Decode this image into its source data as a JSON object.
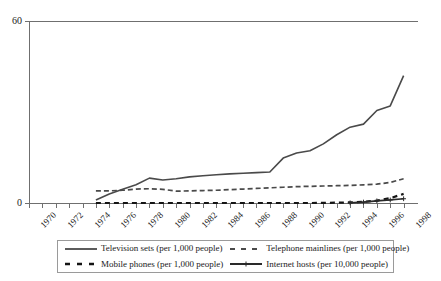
{
  "chart_data": {
    "type": "line",
    "title": "",
    "subtitle": "",
    "xlabel": "",
    "ylabel": "",
    "xlim": [
      1970,
      1999
    ],
    "ylim": [
      0,
      60
    ],
    "grid": false,
    "legend_position": "bottom",
    "y_ticks": [
      "0",
      "60"
    ],
    "y_tick_values": [
      0,
      60
    ],
    "x_tick_labels": [
      "1970",
      "1972",
      "1974",
      "1976",
      "1978",
      "1980",
      "1982",
      "1984",
      "1986",
      "1988",
      "1990",
      "1992",
      "1994",
      "1996",
      "1998"
    ],
    "x_tick_values": [
      1970,
      1972,
      1974,
      1976,
      1978,
      1980,
      1982,
      1984,
      1986,
      1988,
      1990,
      1992,
      1994,
      1996,
      1998
    ],
    "x_minor_ticks": [
      1970,
      1971,
      1972,
      1973,
      1974,
      1975,
      1976,
      1977,
      1978,
      1979,
      1980,
      1981,
      1982,
      1983,
      1984,
      1985,
      1986,
      1987,
      1988,
      1989,
      1990,
      1991,
      1992,
      1993,
      1994,
      1995,
      1996,
      1997,
      1998
    ],
    "series": [
      {
        "name": "Television sets (per 1,000 people)",
        "style": "solid",
        "color": "#4a4a4a",
        "x": [
          1975,
          1976,
          1977,
          1978,
          1979,
          1980,
          1981,
          1982,
          1983,
          1984,
          1985,
          1986,
          1987,
          1988,
          1989,
          1990,
          1991,
          1992,
          1993,
          1994,
          1995,
          1996,
          1997,
          1998
        ],
        "values": [
          1.0,
          3.0,
          4.5,
          6.0,
          8.2,
          7.6,
          8.0,
          8.6,
          9.0,
          9.3,
          9.6,
          9.8,
          10.0,
          10.2,
          14.8,
          16.5,
          17.2,
          19.5,
          22.5,
          25.0,
          26.0,
          30.5,
          32.0,
          42.0
        ]
      },
      {
        "name": "Telephone mainlines (per 1,000 people)",
        "style": "dashed",
        "color": "#4a4a4a",
        "x": [
          1975,
          1976,
          1977,
          1978,
          1979,
          1980,
          1981,
          1982,
          1983,
          1984,
          1985,
          1986,
          1987,
          1988,
          1989,
          1990,
          1991,
          1992,
          1993,
          1994,
          1995,
          1996,
          1997,
          1998
        ],
        "values": [
          4.0,
          4.0,
          4.2,
          4.6,
          4.7,
          4.5,
          3.9,
          4.0,
          4.1,
          4.2,
          4.4,
          4.6,
          4.8,
          5.0,
          5.2,
          5.4,
          5.5,
          5.6,
          5.7,
          5.8,
          6.0,
          6.2,
          6.8,
          8.0
        ]
      },
      {
        "name": "Mobile phones (per 1,000 people)",
        "style": "dashed-heavy",
        "color": "#141414",
        "x": [
          1975,
          1980,
          1985,
          1990,
          1991,
          1992,
          1993,
          1994,
          1995,
          1996,
          1997,
          1998
        ],
        "values": [
          0.0,
          0.0,
          0.0,
          0.0,
          0.0,
          0.05,
          0.1,
          0.2,
          0.4,
          0.8,
          1.6,
          3.0
        ]
      },
      {
        "name": "Internet hosts (per 10,000 people)",
        "style": "solid-marker",
        "color": "#2a2a2a",
        "x": [
          1994,
          1995,
          1996,
          1997,
          1998
        ],
        "values": [
          0.05,
          0.3,
          0.7,
          1.0,
          1.4
        ]
      }
    ]
  },
  "legend": {
    "entries": [
      {
        "label": "Television sets (per 1,000 people)",
        "swatch": "solid-line-swatch"
      },
      {
        "label": "Telephone mainlines (per 1,000 people)",
        "swatch": "dashed-line-swatch"
      },
      {
        "label": "Mobile phones (per 1,000 people)",
        "swatch": "dashed-heavy-swatch"
      },
      {
        "label": "Internet hosts (per 10,000 people)",
        "swatch": "solid-marker-swatch"
      }
    ]
  }
}
